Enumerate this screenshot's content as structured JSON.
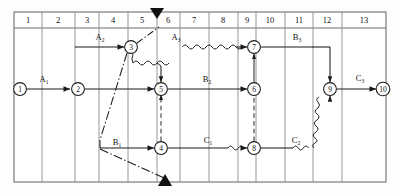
{
  "diagram": {
    "type": "time-scaled-network-diagram",
    "grid": {
      "x_left": 14,
      "x_right": 386,
      "y_top": 12,
      "y_header_bottom": 28,
      "y_bottom": 182,
      "column_count": 13,
      "column_headers": [
        "1",
        "2",
        "3",
        "4",
        "5",
        "6",
        "7",
        "8",
        "9",
        "10",
        "11",
        "12",
        "13"
      ],
      "column_boundaries": [
        14,
        42,
        75,
        99,
        128,
        157,
        180,
        209,
        238,
        256,
        285,
        313,
        342,
        386
      ]
    },
    "colors": {
      "grid_line": "#8a8a8a",
      "border": "#6f6f6f",
      "stroke": "#1a1a1a",
      "node_fill": "#ffffff",
      "background": "#fdfdfc"
    },
    "nodes": [
      {
        "id": "1",
        "label": "1",
        "x": 20,
        "y": 89
      },
      {
        "id": "2",
        "label": "2",
        "x": 78,
        "y": 89
      },
      {
        "id": "3",
        "label": "3",
        "x": 131,
        "y": 47
      },
      {
        "id": "4",
        "label": "4",
        "x": 161,
        "y": 148
      },
      {
        "id": "5",
        "label": "5",
        "x": 161,
        "y": 89
      },
      {
        "id": "6",
        "label": "6",
        "x": 254,
        "y": 89
      },
      {
        "id": "7",
        "label": "7",
        "x": 254,
        "y": 47
      },
      {
        "id": "8",
        "label": "8",
        "x": 254,
        "y": 148
      },
      {
        "id": "9",
        "label": "9",
        "x": 330,
        "y": 89
      },
      {
        "id": "10",
        "label": "10",
        "x": 383,
        "y": 89
      }
    ],
    "activity_labels": [
      {
        "name": "A1",
        "base": "A",
        "sub": "1",
        "x": 44,
        "y": 82
      },
      {
        "name": "A2",
        "base": "A",
        "sub": "2",
        "x": 100,
        "y": 40
      },
      {
        "name": "A3",
        "base": "A",
        "sub": "3",
        "x": 176,
        "y": 40
      },
      {
        "name": "B1",
        "base": "B",
        "sub": "1",
        "x": 117,
        "y": 145
      },
      {
        "name": "B2",
        "base": "B",
        "sub": "2",
        "x": 207,
        "y": 82
      },
      {
        "name": "B3",
        "base": "B",
        "sub": "3",
        "x": 297,
        "y": 40
      },
      {
        "name": "C1",
        "base": "C",
        "sub": "1",
        "x": 208,
        "y": 143
      },
      {
        "name": "C2",
        "base": "C",
        "sub": "2",
        "x": 296,
        "y": 143
      },
      {
        "name": "C3",
        "base": "C",
        "sub": "3",
        "x": 360,
        "y": 81
      }
    ],
    "markers": [
      {
        "name": "top-milestone-triangle",
        "direction": "down",
        "x": 157,
        "y": 12
      },
      {
        "name": "bottom-milestone-triangle",
        "direction": "up",
        "x": 165,
        "y": 182
      }
    ],
    "edges": [
      {
        "name": "edge-1-to-2",
        "from": "1",
        "to": "2",
        "style": "solid"
      },
      {
        "name": "edge-2-to-5",
        "from": "2",
        "to": "5",
        "style": "solid"
      },
      {
        "name": "edge-a2-to-3",
        "from": "col3",
        "to": "3",
        "style": "solid"
      },
      {
        "name": "edge-3-to-a3",
        "from": "3",
        "to": "top",
        "style": "dash-dot"
      },
      {
        "name": "edge-a3-to-7",
        "from": "A3",
        "to": "7",
        "style": "wavy"
      },
      {
        "name": "edge-3-to-5",
        "from": "3",
        "to": "5",
        "style": "wavy"
      },
      {
        "name": "edge-3-to-b1",
        "from": "3",
        "to": "B1",
        "style": "dash-dot"
      },
      {
        "name": "edge-b1-to-4",
        "from": "B1",
        "to": "4",
        "style": "solid"
      },
      {
        "name": "edge-b1-to-bottom",
        "from": "B1",
        "to": "bottom",
        "style": "dash-dot"
      },
      {
        "name": "edge-5-to-6",
        "from": "5",
        "to": "6",
        "style": "solid"
      },
      {
        "name": "edge-4-to-8",
        "from": "4",
        "to": "8",
        "style": "solid-wavy"
      },
      {
        "name": "edge-8-to-9",
        "from": "8",
        "to": "9",
        "style": "solid-wavy"
      },
      {
        "name": "edge-7-to-b3",
        "from": "7",
        "to": "B3",
        "style": "solid"
      },
      {
        "name": "edge-b3-to-9",
        "from": "B3",
        "to": "9",
        "style": "solid"
      },
      {
        "name": "edge-9-to-10",
        "from": "9",
        "to": "10",
        "style": "solid"
      },
      {
        "name": "edge-6-to-7",
        "from": "6",
        "to": "7",
        "style": "dashed-vertical"
      },
      {
        "name": "edge-8-to-6",
        "from": "8",
        "to": "6",
        "style": "dashed-vertical"
      }
    ]
  }
}
